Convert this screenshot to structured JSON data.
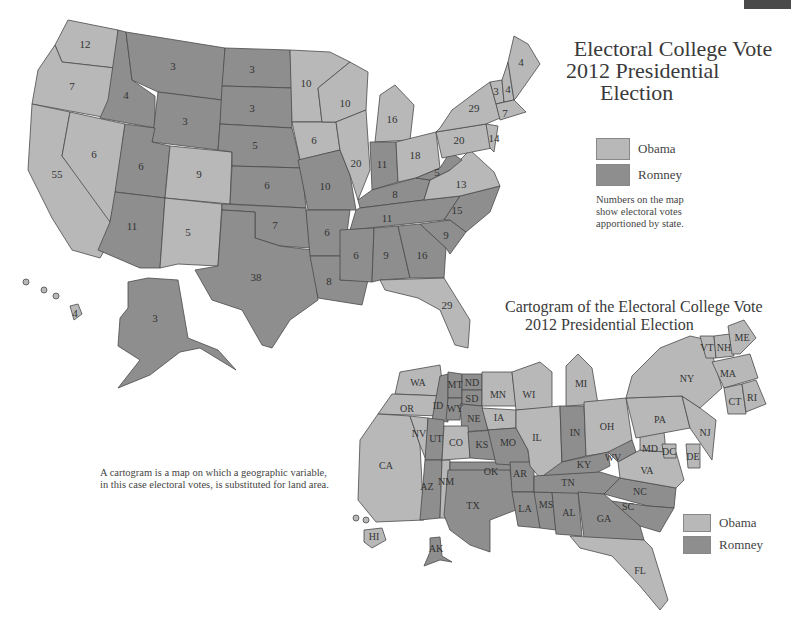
{
  "colors": {
    "obama": "#b8b8b8",
    "romney": "#8e8e8e",
    "border": "#4a4a4a",
    "background": "#ffffff"
  },
  "top_map": {
    "title_lines": [
      "Electoral College Vote",
      "2012 Presidential",
      "Election"
    ],
    "legend": [
      {
        "label": "Obama",
        "party": "obama"
      },
      {
        "label": "Romney",
        "party": "romney"
      }
    ],
    "note_lines": [
      "Numbers on the map",
      "show electoral votes",
      "apportioned by state."
    ],
    "states": [
      {
        "state": "WA",
        "votes": "12",
        "party": "obama"
      },
      {
        "state": "OR",
        "votes": "7",
        "party": "obama"
      },
      {
        "state": "CA",
        "votes": "55",
        "party": "obama"
      },
      {
        "state": "NV",
        "votes": "6",
        "party": "obama"
      },
      {
        "state": "ID",
        "votes": "4",
        "party": "romney"
      },
      {
        "state": "MT",
        "votes": "3",
        "party": "romney"
      },
      {
        "state": "WY",
        "votes": "3",
        "party": "romney"
      },
      {
        "state": "UT",
        "votes": "6",
        "party": "romney"
      },
      {
        "state": "AZ",
        "votes": "11",
        "party": "romney"
      },
      {
        "state": "CO",
        "votes": "9",
        "party": "obama"
      },
      {
        "state": "NM",
        "votes": "5",
        "party": "obama"
      },
      {
        "state": "ND",
        "votes": "3",
        "party": "romney"
      },
      {
        "state": "SD",
        "votes": "3",
        "party": "romney"
      },
      {
        "state": "NE",
        "votes": "5",
        "party": "romney"
      },
      {
        "state": "KS",
        "votes": "6",
        "party": "romney"
      },
      {
        "state": "OK",
        "votes": "7",
        "party": "romney"
      },
      {
        "state": "TX",
        "votes": "38",
        "party": "romney"
      },
      {
        "state": "MN",
        "votes": "10",
        "party": "obama"
      },
      {
        "state": "IA",
        "votes": "6",
        "party": "obama"
      },
      {
        "state": "MO",
        "votes": "10",
        "party": "romney"
      },
      {
        "state": "AR",
        "votes": "6",
        "party": "romney"
      },
      {
        "state": "LA",
        "votes": "8",
        "party": "romney"
      },
      {
        "state": "WI",
        "votes": "10",
        "party": "obama"
      },
      {
        "state": "IL",
        "votes": "20",
        "party": "obama"
      },
      {
        "state": "MI",
        "votes": "16",
        "party": "obama"
      },
      {
        "state": "IN",
        "votes": "11",
        "party": "romney"
      },
      {
        "state": "OH",
        "votes": "18",
        "party": "obama"
      },
      {
        "state": "KY",
        "votes": "8",
        "party": "romney"
      },
      {
        "state": "TN",
        "votes": "11",
        "party": "romney"
      },
      {
        "state": "MS",
        "votes": "6",
        "party": "romney"
      },
      {
        "state": "AL",
        "votes": "9",
        "party": "romney"
      },
      {
        "state": "GA",
        "votes": "16",
        "party": "romney"
      },
      {
        "state": "FL",
        "votes": "29",
        "party": "obama"
      },
      {
        "state": "SC",
        "votes": "9",
        "party": "romney"
      },
      {
        "state": "NC",
        "votes": "15",
        "party": "romney"
      },
      {
        "state": "VA",
        "votes": "13",
        "party": "obama"
      },
      {
        "state": "WV",
        "votes": "5",
        "party": "romney"
      },
      {
        "state": "PA",
        "votes": "20",
        "party": "obama"
      },
      {
        "state": "NY",
        "votes": "29",
        "party": "obama"
      },
      {
        "state": "VT",
        "votes": "3",
        "party": "obama"
      },
      {
        "state": "NH",
        "votes": "4",
        "party": "obama"
      },
      {
        "state": "ME",
        "votes": "4",
        "party": "obama"
      },
      {
        "state": "MA-CT-RI",
        "votes": "7",
        "party": "obama"
      },
      {
        "state": "NJ",
        "votes": "14",
        "party": "obama"
      },
      {
        "state": "AK",
        "votes": "3",
        "party": "romney"
      },
      {
        "state": "HI",
        "votes": "4",
        "party": "obama"
      }
    ]
  },
  "cartogram": {
    "title_lines": [
      "Cartogram of the Electoral College Vote",
      "2012 Presidential Election"
    ],
    "note_lines": [
      "A cartogram is a map on which a geographic variable,",
      "in this case electoral votes, is substituted for land area."
    ],
    "legend": [
      {
        "label": "Obama",
        "party": "obama"
      },
      {
        "label": "Romney",
        "party": "romney"
      }
    ],
    "labels": [
      "WA",
      "OR",
      "CA",
      "NV",
      "ID",
      "MT",
      "ND",
      "SD",
      "WY",
      "NE",
      "UT",
      "CO",
      "AZ",
      "NM",
      "KS",
      "MO",
      "OK",
      "AR",
      "TX",
      "LA",
      "MS",
      "AL",
      "TN",
      "GA",
      "SC",
      "NC",
      "KY",
      "WV",
      "VA",
      "MD",
      "DC",
      "DE",
      "NJ",
      "PA",
      "OH",
      "IN",
      "IL",
      "IA",
      "MN",
      "WI",
      "MI",
      "NY",
      "VT",
      "NH",
      "ME",
      "MA",
      "CT",
      "RI",
      "FL",
      "HI",
      "AK"
    ]
  }
}
